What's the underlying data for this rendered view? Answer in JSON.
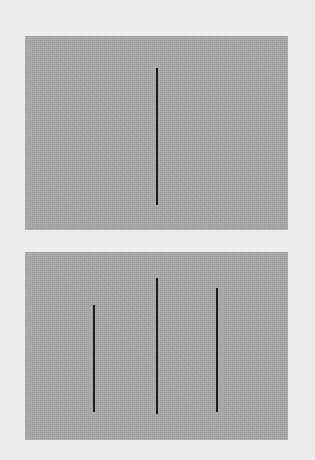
{
  "image": {
    "title": "Vertical line length comparison stimulus",
    "width": 315,
    "height": 460,
    "background_color": "#f2f2f2",
    "panel_color": "#ababab",
    "line_color": "#1a1a1a"
  },
  "panels": [
    {
      "id": "reference-panel",
      "role": "reference",
      "label": "top panel",
      "x": 25,
      "y": 36,
      "width": 263,
      "height": 194,
      "fill": "#ababab",
      "lines": [
        {
          "id": "reference-line",
          "label": "reference line",
          "x": 156,
          "y": 68,
          "width": 2,
          "height": 137,
          "color": "#1a1a1a"
        }
      ]
    },
    {
      "id": "comparison-panel",
      "role": "comparison",
      "label": "bottom panel",
      "x": 25,
      "y": 252,
      "width": 263,
      "height": 188,
      "fill": "#ababab",
      "lines": [
        {
          "id": "comparison-line-1",
          "label": "comparison line 1 (left)",
          "x": 93,
          "y": 305,
          "width": 2,
          "height": 107,
          "color": "#1a1a1a"
        },
        {
          "id": "comparison-line-2",
          "label": "comparison line 2 (center)",
          "x": 156,
          "y": 278,
          "width": 2,
          "height": 136,
          "color": "#1a1a1a"
        },
        {
          "id": "comparison-line-3",
          "label": "comparison line 3 (right)",
          "x": 216,
          "y": 288,
          "width": 2,
          "height": 124,
          "color": "#1a1a1a"
        }
      ]
    }
  ],
  "chart_data": {
    "type": "bar",
    "xlabel": "Line",
    "ylabel": "Length (px)",
    "categories": [
      "reference-line",
      "comparison-line-1",
      "comparison-line-2",
      "comparison-line-3"
    ],
    "values": [
      137,
      107,
      136,
      124
    ],
    "ylim": [
      0,
      150
    ],
    "grid": false,
    "legend": "none"
  }
}
